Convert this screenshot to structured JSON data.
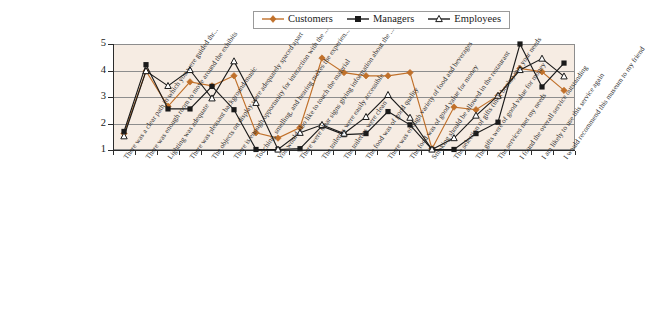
{
  "legend": {
    "position": "top-center",
    "items": [
      {
        "label": "Customers",
        "color": "#c0702a",
        "marker": "diamond"
      },
      {
        "label": "Managers",
        "color": "#1a1a1a",
        "marker": "square"
      },
      {
        "label": "Employees",
        "color": "#1a1a1a",
        "marker": "triangle-open"
      }
    ]
  },
  "axes": {
    "y_ticks": [
      "5",
      "4",
      "3",
      "2",
      "1"
    ],
    "y_min": 1,
    "y_max": 5,
    "grid": true,
    "plot_background": "#f6ece3",
    "frame_color": "#8d8d8d"
  },
  "chart_data": {
    "type": "line",
    "title": "",
    "subtitle": "",
    "xlabel": "",
    "ylabel": "",
    "ylim": [
      1,
      5
    ],
    "grid": true,
    "legend_position": "top-center",
    "categories": [
      "There was a clear path in which you were guided thr...",
      "There was enough room to move around the exhibits",
      "Lighting was adequate",
      "There was pleasant background music",
      "The objects on display were adequately spaced apart",
      "There is enough opportunity for interaction with the ...",
      "Touching, smelling, and hearing makes the experien...",
      "You would also like to touch the material",
      "There were clear signs giving information about the ...",
      "The toilettes were easily accessible",
      "The toilettes were clean",
      "The food was of good quality",
      "There was enough variety of food and beverages",
      "The food was of good value for money",
      "Smoking should be allowed in the restaurant",
      "The selection of gifts (incl. books) met your needs",
      "The gifts were of good value for money",
      "The services met my needs",
      "I found the overall service outstanding",
      "I am likely to use this service again",
      "I would recommend this museum to my friend"
    ],
    "series": [
      {
        "name": "Customers",
        "color": "#c0702a",
        "marker": "diamond",
        "values": [
          1.62,
          3.98,
          2.65,
          3.57,
          3.42,
          3.8,
          1.65,
          1.45,
          1.85,
          4.47,
          3.92,
          3.8,
          3.8,
          3.92,
          1.05,
          2.62,
          2.52,
          3.05,
          4.08,
          3.95,
          3.25
        ]
      },
      {
        "name": "Managers",
        "color": "#1a1a1a",
        "marker": "square",
        "values": [
          1.7,
          4.22,
          2.55,
          2.55,
          3.4,
          2.52,
          1.02,
          1.02,
          1.05,
          1.9,
          1.58,
          1.62,
          2.45,
          1.95,
          1.02,
          1.02,
          1.62,
          2.05,
          5.0,
          3.38,
          4.28
        ]
      },
      {
        "name": "Employees",
        "color": "#1a1a1a",
        "marker": "triangle-open",
        "values": [
          1.52,
          3.98,
          3.42,
          4.02,
          2.95,
          4.35,
          2.78,
          1.02,
          1.65,
          1.95,
          1.62,
          2.25,
          3.08,
          2.22,
          1.02,
          1.45,
          2.3,
          3.05,
          4.02,
          4.45,
          3.78
        ]
      }
    ]
  }
}
